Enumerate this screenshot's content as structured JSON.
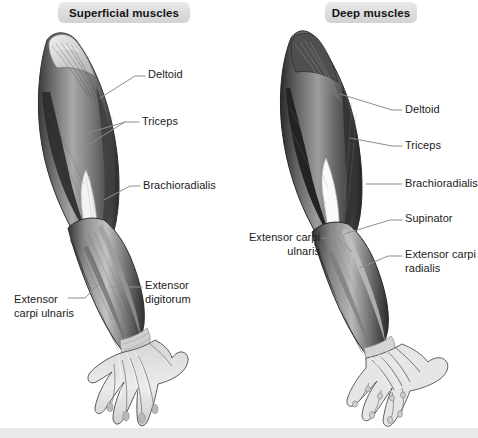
{
  "figure": {
    "panels": [
      {
        "id": "superficial",
        "header": "Superficial muscles",
        "side": "left",
        "labels": [
          {
            "name": "deltoid",
            "text": "Deltoid"
          },
          {
            "name": "triceps",
            "text": "Triceps"
          },
          {
            "name": "brachioradialis",
            "text": "Brachioradialis"
          },
          {
            "name": "extensor-digitorum",
            "text": "Extensor\ndigitorum"
          },
          {
            "name": "extensor-carpi-ulnaris",
            "text": "Extensor\ncarpi ulnaris"
          }
        ]
      },
      {
        "id": "deep",
        "header": "Deep muscles",
        "side": "right",
        "labels": [
          {
            "name": "deltoid",
            "text": "Deltoid"
          },
          {
            "name": "triceps",
            "text": "Triceps"
          },
          {
            "name": "brachioradialis",
            "text": "Brachioradialis"
          },
          {
            "name": "supinator",
            "text": "Supinator"
          },
          {
            "name": "extensor-carpi-radialis",
            "text": "Extensor carpi\nradialis"
          },
          {
            "name": "extensor-carpi-ulnaris",
            "text": "Extensor carpi\nulnaris"
          }
        ]
      }
    ],
    "colors": {
      "page_background": "#ffffff",
      "pill_background": "#dcdcdc",
      "pill_text": "#141414",
      "label_text": "#1a1a1a",
      "leader_line": "#8a8a8a",
      "bottom_band": "#e9e9e9",
      "muscle_dark": "#2e2e2e",
      "muscle_mid": "#6f6f6f",
      "muscle_light": "#bdbdbd",
      "tendon_white": "#f6f6f6",
      "outline": "#3a3a3a"
    }
  }
}
